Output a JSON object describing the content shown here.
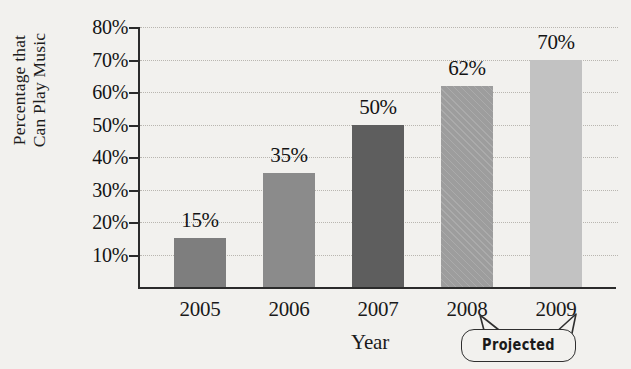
{
  "chart_data": {
    "type": "bar",
    "title": "",
    "xlabel": "Year",
    "ylabel": "Percentage that Can Play Music",
    "ylabel_lines": [
      "Percentage that",
      "Can Play Music"
    ],
    "categories": [
      "2005",
      "2006",
      "2007",
      "2008",
      "2009"
    ],
    "values": [
      15,
      35,
      50,
      62,
      70
    ],
    "value_labels": [
      "15%",
      "35%",
      "50%",
      "62%",
      "70%"
    ],
    "ylim": [
      0,
      80
    ],
    "ytick_values": [
      10,
      20,
      30,
      40,
      50,
      60,
      70,
      80
    ],
    "ytick_labels": [
      "10%",
      "20%",
      "30%",
      "40%",
      "50%",
      "60%",
      "70%",
      "80%"
    ],
    "grid": true,
    "legend": false,
    "bar_colors": [
      "#7e7e7e",
      "#8b8b8b",
      "#5e5e5e",
      "#9d9d9d",
      "#c2c2c2"
    ],
    "bar_hatched": [
      false,
      false,
      false,
      true,
      false
    ],
    "annotations": [
      {
        "text": "Projected",
        "points_to": [
          "2008",
          "2009"
        ]
      }
    ],
    "background_color": "#f2f1ee",
    "axis_color": "#2b2b2b",
    "gridline_color": "#b9b6b0",
    "text_color": "#141414"
  }
}
